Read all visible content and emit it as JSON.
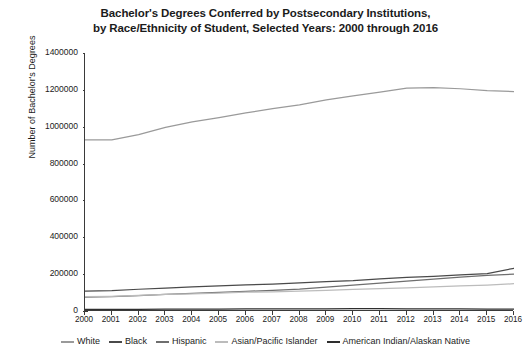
{
  "chart_data": {
    "type": "line",
    "title": "Bachelor's Degrees Conferred by Postsecondary Institutions,",
    "title_line2": "by Race/Ethnicity of Student, Selected Years: 2000 through 2016",
    "xlabel": "",
    "ylabel": "Number of Bachelor's Degrees",
    "x": [
      2000,
      2001,
      2002,
      2003,
      2004,
      2005,
      2006,
      2007,
      2008,
      2009,
      2010,
      2011,
      2012,
      2013,
      2014,
      2015,
      2016
    ],
    "xtick_labels": [
      "2000",
      "2001",
      "2002",
      "2003",
      "2004",
      "2005",
      "2006",
      "2007",
      "2008",
      "2009",
      "2010",
      "2011",
      "2012",
      "2013",
      "2014",
      "2015",
      "2016"
    ],
    "ylim": [
      0,
      1400000
    ],
    "ytick_values": [
      0,
      200000,
      400000,
      600000,
      800000,
      1000000,
      1200000,
      1400000
    ],
    "ytick_labels": [
      "0",
      "200000",
      "400000",
      "600000",
      "800000",
      "1000000",
      "1200000",
      "1400000"
    ],
    "grid": false,
    "legend_position": "bottom",
    "series": [
      {
        "name": "White",
        "color": "#9a9a9a",
        "values": [
          929106,
          928000,
          957000,
          996000,
          1026000,
          1049000,
          1075000,
          1098000,
          1119000,
          1145000,
          1167000,
          1188000,
          1210000,
          1212000,
          1206000,
          1196000,
          1191000
        ]
      },
      {
        "name": "Black",
        "color": "#4a4a4a",
        "values": [
          108000,
          111000,
          118000,
          124000,
          131000,
          136000,
          142000,
          146000,
          152000,
          160000,
          165000,
          174000,
          183000,
          188000,
          196000,
          203000,
          232000
        ]
      },
      {
        "name": "Hispanic",
        "color": "#6e6e6e",
        "values": [
          75000,
          78000,
          83000,
          90000,
          95000,
          101000,
          107000,
          112000,
          119000,
          130000,
          140000,
          151000,
          162000,
          173000,
          184000,
          193000,
          200000
        ]
      },
      {
        "name": "Asian/Pacific Islander",
        "color": "#bcbcbc",
        "values": [
          78000,
          80000,
          85000,
          90000,
          93000,
          97000,
          102000,
          104000,
          108000,
          112000,
          117000,
          121000,
          126000,
          131000,
          136000,
          141000,
          148000
        ]
      },
      {
        "name": "American Indian/Alaskan Native",
        "color": "#2e2e2e",
        "values": [
          8700,
          9000,
          9300,
          9700,
          10000,
          10400,
          10900,
          11000,
          11500,
          11900,
          12400,
          12500,
          12000,
          11600,
          11100,
          10700,
          10500
        ]
      }
    ]
  }
}
